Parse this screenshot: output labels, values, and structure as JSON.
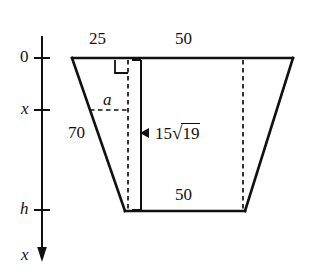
{
  "figure": {
    "shape": "trapezoid",
    "stroke_color": "#111111",
    "background_color": "#ffffff",
    "axis": {
      "name": "depth-axis",
      "orientation": "vertical-downward",
      "arrow_direction": "down",
      "arrow_label": "x",
      "ticks": [
        {
          "label": "0",
          "position": "top"
        },
        {
          "label": "x",
          "position": "middle"
        },
        {
          "label": "h",
          "position": "bottom"
        }
      ]
    },
    "labels": {
      "top_left_segment": "25",
      "top_right_segment": "50",
      "bottom_segment": "50",
      "left_slant_side": "70",
      "horizontal_dashed_segment": "a",
      "vertical_measure_coefficient": "15",
      "vertical_measure_radicand": "19",
      "vertical_measure_full": "15√19"
    },
    "markers": {
      "right_angle": "right-angle-square",
      "measure_arrow": "left-pointing-arrowhead"
    }
  }
}
